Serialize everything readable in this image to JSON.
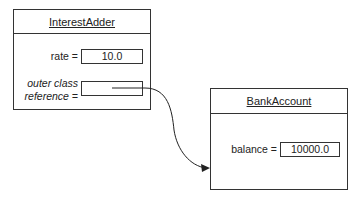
{
  "interest_adder": {
    "title": "InterestAdder",
    "rate_label": "rate =",
    "rate_value": "10.0",
    "outer_label_line1": "outer class",
    "outer_label_line2": "reference =",
    "outer_value": ""
  },
  "bank_account": {
    "title": "BankAccount",
    "balance_label": "balance =",
    "balance_value": "10000.0"
  }
}
